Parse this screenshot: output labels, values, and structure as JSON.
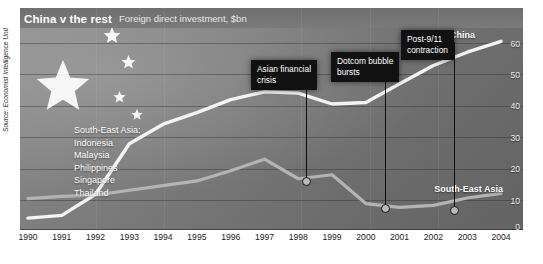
{
  "header": {
    "title": "China v the rest",
    "subtitle": "Foreign direct investment, $bn"
  },
  "source": "Source: Economist Intelligence Unit",
  "legend": {
    "heading": "South-East Asia:",
    "countries": [
      "Indonesia",
      "Malaysia",
      "Philippines",
      "Singapore",
      "Thailand"
    ]
  },
  "series_labels": {
    "china": "China",
    "south_east_asia": "South-East Asia"
  },
  "annotations": [
    {
      "lines": [
        "Asian financial",
        "crisis"
      ],
      "year": 1998,
      "value": 16
    },
    {
      "lines": [
        "Dotcom bubble",
        "bursts"
      ],
      "year": 2000.5,
      "value": 8
    },
    {
      "lines": [
        "Post-9/11",
        "contraction"
      ],
      "year": 2002.5,
      "value": 7.5
    }
  ],
  "colors": {
    "china_line": "#f2f2f2",
    "sea_line": "#b0b0b0",
    "annotation_box": "#111111",
    "plot_background": "#7c7c7c",
    "axis_text": "#1a1a1a"
  },
  "chart_data": {
    "type": "line",
    "title": "China v the rest",
    "subtitle": "Foreign direct investment, $bn",
    "xlabel": "",
    "ylabel": "$bn",
    "xlim": [
      1990,
      2004
    ],
    "ylim": [
      0,
      62
    ],
    "yticks": [
      0,
      10,
      20,
      30,
      40,
      50,
      60
    ],
    "xticks": [
      1990,
      1991,
      1992,
      1993,
      1994,
      1995,
      1996,
      1997,
      1998,
      1999,
      2000,
      2001,
      2002,
      2003,
      2004
    ],
    "x": [
      1990,
      1991,
      1992,
      1993,
      1994,
      1995,
      1996,
      1997,
      1998,
      1999,
      2000,
      2001,
      2002,
      2003,
      2004
    ],
    "grid": true,
    "legend_position": "inline-labels",
    "series": [
      {
        "name": "China",
        "values": [
          3.5,
          4.4,
          11.2,
          27.5,
          33.8,
          37.5,
          41.7,
          44.2,
          43.8,
          40.3,
          40.8,
          46.8,
          52.7,
          57.0,
          60.5
        ]
      },
      {
        "name": "South-East Asia",
        "values": [
          9.8,
          10.5,
          10.9,
          12.5,
          14.0,
          15.5,
          18.8,
          22.5,
          16.2,
          17.5,
          8.2,
          7.0,
          7.6,
          10.0,
          11.5
        ]
      }
    ]
  }
}
